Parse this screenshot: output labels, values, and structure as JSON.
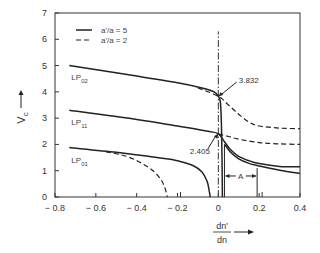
{
  "chart_data": {
    "type": "line",
    "title": "",
    "xlabel": "dn'/dn",
    "ylabel": "V_c",
    "xlim": [
      -0.8,
      0.4
    ],
    "ylim": [
      0,
      7
    ],
    "grid": false,
    "legend_position": "upper-left",
    "x_ticks": [
      -0.8,
      -0.6,
      -0.4,
      -0.2,
      0,
      0.2,
      0.4
    ],
    "x_tick_labels": [
      "− 0.8",
      "− 0.6",
      "− 0.4",
      "− 0.2",
      "0",
      "0.2",
      "0.4"
    ],
    "y_ticks": [
      0,
      1,
      2,
      3,
      4,
      5,
      6,
      7
    ],
    "y_tick_labels": [
      "0",
      "1",
      "2",
      "3",
      "4",
      "5",
      "6",
      "7"
    ],
    "legend": [
      {
        "label": "a'/a = 5",
        "style": "solid"
      },
      {
        "label": "a'/a = 2",
        "style": "dashed"
      }
    ],
    "mode_labels": [
      {
        "text": "LP",
        "sub": "02",
        "x": -0.72,
        "y": 4.45
      },
      {
        "text": "LP",
        "sub": "11",
        "x": -0.72,
        "y": 2.75
      },
      {
        "text": "LP",
        "sub": "01",
        "x": -0.72,
        "y": 1.3
      }
    ],
    "annotations": [
      {
        "text": "3.832",
        "point": [
          0,
          3.832
        ],
        "text_pos": [
          0.1,
          4.45
        ]
      },
      {
        "text": "2.405",
        "point": [
          0,
          2.405
        ],
        "text_pos": [
          -0.12,
          1.75
        ]
      },
      {
        "text": "A",
        "between_x": [
          0.03,
          0.19
        ],
        "y": 0.8
      }
    ],
    "series": [
      {
        "name": "LP02 a'/a=5",
        "style": "solid",
        "points": [
          [
            -0.73,
            5.0
          ],
          [
            -0.4,
            4.6
          ],
          [
            -0.2,
            4.35
          ],
          [
            -0.08,
            4.15
          ],
          [
            -0.02,
            4.0
          ],
          [
            0,
            3.832
          ],
          [
            0.01,
            3.6
          ],
          [
            0.015,
            2.8
          ],
          [
            0.018,
            1.5
          ],
          [
            0.02,
            0
          ]
        ]
      },
      {
        "name": "LP02 a'/a=2",
        "style": "dashed",
        "points": [
          [
            -0.1,
            4.15
          ],
          [
            0,
            3.832
          ],
          [
            0.05,
            3.5
          ],
          [
            0.1,
            3.15
          ],
          [
            0.15,
            2.85
          ],
          [
            0.2,
            2.7
          ],
          [
            0.3,
            2.62
          ],
          [
            0.4,
            2.6
          ]
        ]
      },
      {
        "name": "LP11 a'/a=5",
        "style": "solid",
        "points": [
          [
            -0.73,
            3.3
          ],
          [
            -0.4,
            2.95
          ],
          [
            -0.2,
            2.7
          ],
          [
            -0.05,
            2.5
          ],
          [
            0,
            2.405
          ],
          [
            0.03,
            2.1
          ],
          [
            0.06,
            1.8
          ],
          [
            0.1,
            1.55
          ],
          [
            0.15,
            1.38
          ],
          [
            0.2,
            1.27
          ],
          [
            0.3,
            1.16
          ],
          [
            0.4,
            1.15
          ]
        ]
      },
      {
        "name": "LP11 a'/a=5 (lower branch)",
        "style": "solid",
        "points": [
          [
            0.03,
            2.0
          ],
          [
            0.06,
            1.7
          ],
          [
            0.1,
            1.45
          ],
          [
            0.15,
            1.28
          ],
          [
            0.2,
            1.18
          ],
          [
            0.3,
            1.02
          ],
          [
            0.4,
            0.9
          ]
        ]
      },
      {
        "name": "LP11 a'/a=2",
        "style": "dashed",
        "points": [
          [
            0,
            2.405
          ],
          [
            0.05,
            2.3
          ],
          [
            0.1,
            2.2
          ],
          [
            0.2,
            2.07
          ],
          [
            0.3,
            2.02
          ],
          [
            0.4,
            2.0
          ]
        ]
      },
      {
        "name": "LP01 a'/a=5",
        "style": "solid",
        "points": [
          [
            -0.73,
            1.88
          ],
          [
            -0.5,
            1.7
          ],
          [
            -0.3,
            1.5
          ],
          [
            -0.2,
            1.38
          ],
          [
            -0.12,
            1.18
          ],
          [
            -0.08,
            0.95
          ],
          [
            -0.055,
            0.6
          ],
          [
            -0.045,
            0.25
          ],
          [
            -0.04,
            0
          ]
        ]
      },
      {
        "name": "LP01 a'/a=2",
        "style": "dashed",
        "points": [
          [
            -0.55,
            1.72
          ],
          [
            -0.45,
            1.55
          ],
          [
            -0.38,
            1.3
          ],
          [
            -0.32,
            1.0
          ],
          [
            -0.28,
            0.65
          ],
          [
            -0.26,
            0.3
          ],
          [
            -0.25,
            0
          ]
        ]
      }
    ],
    "vertical_lines": [
      {
        "x": 0,
        "y_range": [
          0,
          6.3
        ],
        "style": "dash-dot"
      },
      {
        "x": 0.03,
        "y_range": [
          0,
          2.0
        ],
        "style": "solid"
      },
      {
        "x": 0.19,
        "y_range": [
          0,
          1.1
        ],
        "style": "solid"
      }
    ],
    "small_ticks_bottom": [
      -0.2,
      0.2
    ]
  }
}
